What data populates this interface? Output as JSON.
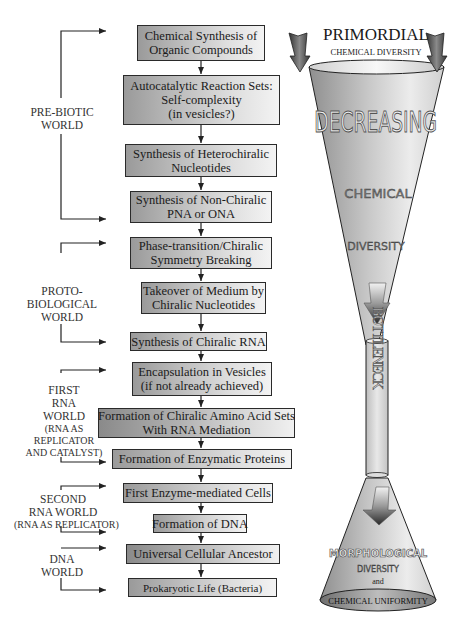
{
  "flowchart": {
    "steps": [
      {
        "lines": [
          "Chemical  Synthesis of",
          "Organic Compounds"
        ]
      },
      {
        "lines": [
          "Autocatalytic Reaction Sets:",
          "Self-complexity",
          "(in vesicles?)"
        ]
      },
      {
        "lines": [
          "Synthesis of Heterochiralic",
          "Nucleotides"
        ]
      },
      {
        "lines": [
          "Synthesis of Non-Chiralic",
          "PNA or ONA"
        ]
      },
      {
        "lines": [
          "Phase-transition/Chiralic",
          "Symmetry Breaking"
        ]
      },
      {
        "lines": [
          "Takeover of Medium by",
          "Chiralic Nucleotides"
        ]
      },
      {
        "lines": [
          "Synthesis of Chiralic RNA"
        ]
      },
      {
        "lines": [
          "Encapsulation in Vesicles",
          "(if not already achieved)"
        ]
      },
      {
        "lines": [
          "Formation of Chiralic Amino Acid Sets",
          "With RNA Mediation"
        ]
      },
      {
        "lines": [
          "Formation of Enzymatic Proteins"
        ]
      },
      {
        "lines": [
          "First Enzyme-mediated Cells"
        ]
      },
      {
        "lines": [
          "Formation of DNA"
        ]
      },
      {
        "lines": [
          "Universal Cellular Ancestor"
        ]
      },
      {
        "lines": [
          "Prokaryotic Life (Bacteria)"
        ]
      }
    ]
  },
  "worlds": [
    {
      "lines": [
        "PRE-BIOTIC",
        "WORLD"
      ]
    },
    {
      "lines": [
        "PROTO-",
        "BIOLOGICAL",
        "WORLD"
      ]
    },
    {
      "lines": [
        "FIRST",
        "RNA",
        "WORLD",
        "(RNA AS",
        "REPLICATOR",
        "AND CATALYST)"
      ]
    },
    {
      "lines": [
        "SECOND",
        "RNA WORLD",
        "(RNA AS REPLICATOR)"
      ]
    },
    {
      "lines": [
        "DNA",
        "WORLD"
      ]
    }
  ],
  "funnel": {
    "top_title": "PRIMORDIAL",
    "top_subtitle": "CHEMICAL DIVERSITY",
    "upper_words": [
      "DECREASING",
      "CHEMICAL",
      "DIVERSITY"
    ],
    "neck_word": "BOTTLENECK",
    "lower_title": "MORPHOLOGICAL",
    "lower_word": "DIVERSITY",
    "lower_and": "and",
    "bottom_label": "CHEMICAL UNIFORMITY"
  },
  "colors": {
    "box_border": "#2a2a2a",
    "box_gradient_dark": "#9a9a9a",
    "box_gradient_light": "#f3f3f3",
    "funnel_gray": "#b8b8b8",
    "arrow": "#222222"
  }
}
